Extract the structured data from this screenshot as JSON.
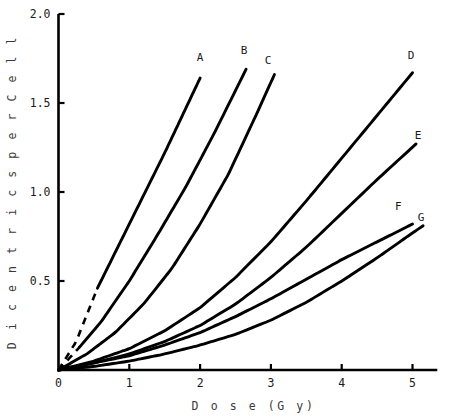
{
  "chart_data": {
    "type": "line",
    "title": "",
    "xlabel": "D o s e  (G y)",
    "ylabel": "D i c e n t r i c s   p e r   C e l l",
    "xlabel_plain": "Dose (Gy)",
    "ylabel_plain": "Dicentrics per Cell",
    "xlim": [
      0,
      5.35
    ],
    "ylim": [
      0,
      2.0
    ],
    "xticks": [
      0,
      1,
      2,
      3,
      4,
      5
    ],
    "xticklabels": [
      "0",
      "1",
      "2",
      "3",
      "4",
      "5"
    ],
    "yticks": [
      0.5,
      1.0,
      1.5,
      2.0
    ],
    "yticklabels": [
      "0.5",
      "1.0",
      "1.5",
      "2.0"
    ],
    "grid": false,
    "legend": "inline-end-labels",
    "line_color": "#000000",
    "background": "#ffffff",
    "series": [
      {
        "name": "A",
        "label": "A",
        "dashed_below_dose": 0.55,
        "label_x": 2.0,
        "label_y": 1.76,
        "x": [
          0.0,
          0.25,
          0.55,
          0.8,
          1.0,
          1.25,
          1.5,
          1.75,
          2.0
        ],
        "y": [
          0.0,
          0.16,
          0.46,
          0.66,
          0.82,
          1.02,
          1.22,
          1.43,
          1.64
        ]
      },
      {
        "name": "B",
        "label": "B",
        "dashed_below_dose": 0.3,
        "label_x": 2.62,
        "label_y": 1.8,
        "x": [
          0.0,
          0.3,
          0.6,
          1.0,
          1.4,
          1.8,
          2.2,
          2.65
        ],
        "y": [
          0.0,
          0.13,
          0.27,
          0.5,
          0.76,
          1.03,
          1.33,
          1.69
        ]
      },
      {
        "name": "C",
        "label": "C",
        "dashed_below_dose": 0.0,
        "label_x": 2.96,
        "label_y": 1.74,
        "x": [
          0.0,
          0.4,
          0.8,
          1.2,
          1.6,
          2.0,
          2.4,
          2.8,
          3.05
        ],
        "y": [
          0.0,
          0.09,
          0.21,
          0.37,
          0.57,
          0.82,
          1.1,
          1.44,
          1.66
        ]
      },
      {
        "name": "D",
        "label": "D",
        "dashed_below_dose": 0.0,
        "label_x": 4.98,
        "label_y": 1.77,
        "x": [
          0.0,
          0.5,
          1.0,
          1.5,
          2.0,
          2.5,
          3.0,
          3.5,
          4.0,
          4.5,
          5.0
        ],
        "y": [
          0.0,
          0.05,
          0.12,
          0.22,
          0.35,
          0.52,
          0.72,
          0.95,
          1.19,
          1.43,
          1.67
        ]
      },
      {
        "name": "E",
        "label": "E",
        "dashed_below_dose": 0.0,
        "label_x": 5.08,
        "label_y": 1.32,
        "x": [
          0.0,
          0.5,
          1.0,
          1.5,
          2.0,
          2.5,
          3.0,
          3.5,
          4.0,
          4.5,
          5.05
        ],
        "y": [
          0.0,
          0.04,
          0.09,
          0.16,
          0.25,
          0.37,
          0.52,
          0.69,
          0.88,
          1.07,
          1.27
        ]
      },
      {
        "name": "F",
        "label": "F",
        "label_x": 4.8,
        "label_y": 0.92,
        "dashed_below_dose": 0.0,
        "x": [
          0.0,
          0.5,
          1.0,
          1.5,
          2.0,
          2.5,
          3.0,
          3.5,
          4.0,
          4.5,
          5.0
        ],
        "y": [
          0.0,
          0.04,
          0.08,
          0.14,
          0.21,
          0.3,
          0.4,
          0.51,
          0.62,
          0.72,
          0.82
        ]
      },
      {
        "name": "G",
        "label": "G",
        "label_x": 5.12,
        "label_y": 0.86,
        "dashed_below_dose": 0.0,
        "x": [
          0.0,
          0.5,
          1.0,
          1.5,
          2.0,
          2.5,
          3.0,
          3.5,
          4.0,
          4.5,
          5.0,
          5.15
        ],
        "y": [
          0.0,
          0.02,
          0.05,
          0.09,
          0.14,
          0.2,
          0.28,
          0.38,
          0.5,
          0.63,
          0.77,
          0.81
        ]
      }
    ]
  }
}
